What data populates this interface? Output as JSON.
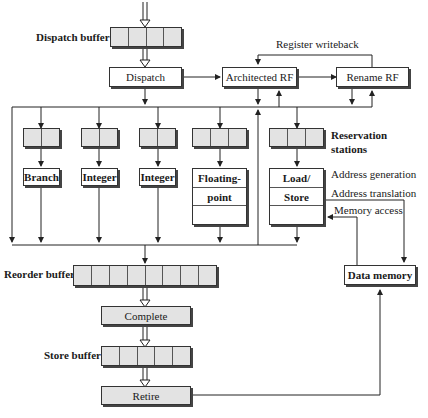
{
  "labels": {
    "dispatch_buffer": "Dispatch buffer",
    "register_writeback": "Register writeback",
    "reservation_stations": [
      "Reservation",
      "stations"
    ],
    "address_generation": "Address generation",
    "address_translation": "Address translation",
    "memory_access": "Memory access",
    "reorder_buffer": "Reorder buffer",
    "store_buffer": "Store buffer"
  },
  "blocks": {
    "dispatch": "Dispatch",
    "architected_rf": "Architected RF",
    "rename_rf": "Rename RF",
    "complete": "Complete",
    "retire": "Retire",
    "data_memory": "Data memory"
  },
  "units": {
    "branch": "Branch",
    "integer1": "Integer",
    "integer2": "Integer",
    "floating_point": [
      "Floating-",
      "point",
      ""
    ],
    "load_store": [
      "Load/",
      "Store",
      ""
    ]
  },
  "buffers": {
    "dispatch_buffer_cells": 4,
    "reorder_buffer_cells": 8,
    "store_buffer_cells": 5,
    "rs_branch_cells": 2,
    "rs_integer1_cells": 2,
    "rs_integer2_cells": 2,
    "rs_fp_cells": 3,
    "rs_ls_cells": 3
  }
}
